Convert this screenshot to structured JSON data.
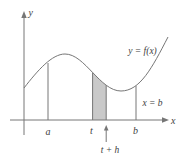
{
  "figure": {
    "labels": {
      "y_axis": "y",
      "x_axis": "x",
      "curve": "y = f(x)",
      "boundary": "x = b",
      "a": "a",
      "t": "t",
      "b": "b",
      "t_plus_h": "t + h"
    },
    "colors": {
      "line": "#767676",
      "text": "#414141",
      "shading": "#c9c9c9",
      "background": "#ffffff"
    }
  }
}
